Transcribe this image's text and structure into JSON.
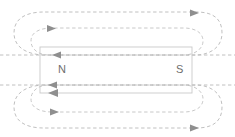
{
  "diagram": {
    "type": "physics-field-diagram",
    "magnet": {
      "north_pole_label": "N",
      "south_pole_label": "S",
      "x": 40,
      "y": 47,
      "width": 152,
      "height": 46,
      "stroke_color": "#c9c9c9"
    },
    "field_lines": {
      "stroke_color": "#b9b9b9",
      "style": "dashed",
      "dash_pattern": "3.4 2.6",
      "loop_count": 4,
      "direction": "north-to-south-outside, south-to-north-inside",
      "loops": [
        {
          "name": "top-outer-loop",
          "arrow_x": 196,
          "arrow_y": 13,
          "arrow_dir": "right"
        },
        {
          "name": "top-inner-loop",
          "arrow_x": 53,
          "arrow_y": 29,
          "arrow_dir": "right"
        },
        {
          "name": "bottom-inner-loop",
          "arrow_x": 56,
          "arrow_y": 110,
          "arrow_dir": "right"
        },
        {
          "name": "bottom-outer-loop",
          "arrow_x": 196,
          "arrow_y": 125,
          "arrow_dir": "right"
        }
      ]
    },
    "interior_arrows": {
      "color": "#8f8f8f",
      "direction": "left",
      "positions": [
        {
          "name": "magnet-arrow-top",
          "x": 57,
          "y": 57
        },
        {
          "name": "magnet-arrow-middle",
          "x": 57,
          "y": 78
        },
        {
          "name": "magnet-arrow-bottom",
          "x": 57,
          "y": 92
        }
      ]
    },
    "colors": {
      "background": "#ffffff",
      "field_line": "#b9b9b9",
      "magnet_outline": "#c9c9c9",
      "label_text": "#6e6e6e",
      "arrow_fill": "#8f8f8f"
    }
  }
}
